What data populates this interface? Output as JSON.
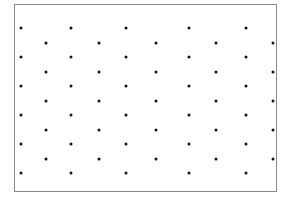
{
  "figure": {
    "background_color": "#ffffff",
    "frame": {
      "border_color": "#8a8a8a",
      "border_width_px": 1,
      "fill_color": "#ffffff",
      "x_px": 14,
      "y_px": 4,
      "width_px": 263,
      "height_px": 188
    }
  },
  "chart_data": {
    "type": "scatter",
    "title": "",
    "subtitle": "",
    "xlabel": "",
    "ylabel": "",
    "legend": [],
    "legend_position": "none",
    "grid": false,
    "axis_ticks": false,
    "axis_tick_labels": [],
    "xlim": [
      0,
      263
    ],
    "ylim": [
      0,
      188
    ],
    "marker": {
      "shape": "circle",
      "color": "#101010",
      "size_px": 3
    },
    "layout": {
      "rows": 11,
      "columns_odd_rows": 5,
      "columns_even_rows": 5,
      "row_pitch_px": 14.5,
      "column_pitch_px": 56,
      "stagger_offset_px": 27
    },
    "series": [
      {
        "name": "odd-row-dots",
        "points": [
          [
            6,
            23
          ],
          [
            56,
            23
          ],
          [
            111,
            23
          ],
          [
            174,
            23
          ],
          [
            231,
            23
          ],
          [
            6,
            52
          ],
          [
            56,
            52
          ],
          [
            111,
            52
          ],
          [
            174,
            52
          ],
          [
            231,
            52
          ],
          [
            6,
            81
          ],
          [
            56,
            81
          ],
          [
            111,
            81
          ],
          [
            174,
            81
          ],
          [
            231,
            81
          ],
          [
            6,
            110
          ],
          [
            56,
            110
          ],
          [
            111,
            110
          ],
          [
            174,
            110
          ],
          [
            231,
            110
          ],
          [
            6,
            139
          ],
          [
            56,
            139
          ],
          [
            111,
            139
          ],
          [
            174,
            139
          ],
          [
            231,
            139
          ],
          [
            6,
            168
          ],
          [
            56,
            168
          ],
          [
            111,
            168
          ],
          [
            174,
            168
          ],
          [
            231,
            168
          ]
        ]
      },
      {
        "name": "even-row-dots",
        "points": [
          [
            31,
            38
          ],
          [
            84,
            38
          ],
          [
            141,
            38
          ],
          [
            201,
            38
          ],
          [
            258,
            38
          ],
          [
            31,
            67
          ],
          [
            84,
            67
          ],
          [
            141,
            67
          ],
          [
            201,
            67
          ],
          [
            258,
            67
          ],
          [
            31,
            96
          ],
          [
            84,
            96
          ],
          [
            141,
            96
          ],
          [
            201,
            96
          ],
          [
            258,
            96
          ],
          [
            31,
            125
          ],
          [
            84,
            125
          ],
          [
            141,
            125
          ],
          [
            201,
            125
          ],
          [
            258,
            125
          ],
          [
            31,
            154
          ],
          [
            84,
            154
          ],
          [
            141,
            154
          ],
          [
            201,
            154
          ],
          [
            258,
            154
          ]
        ]
      }
    ]
  }
}
